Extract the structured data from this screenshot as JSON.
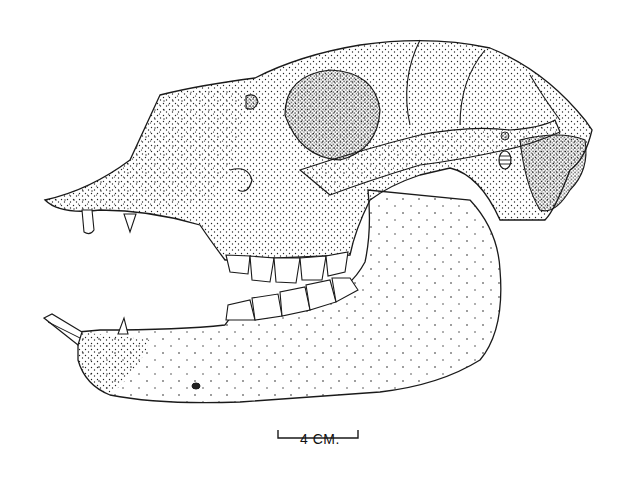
{
  "figure": {
    "style": "stipple ink drawing",
    "ink_color": "#1a1a1a",
    "paper_color": "#ffffff"
  },
  "scale_bar": {
    "label": "4 CM.",
    "length_px": 80
  }
}
